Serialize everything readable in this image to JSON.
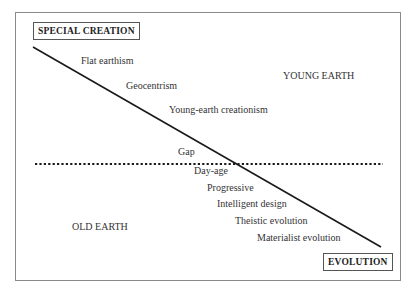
{
  "diagram": {
    "top_left_box": "SPECIAL CREATION",
    "bottom_right_box": "EVOLUTION",
    "region_top_right": "YOUNG EARTH",
    "region_bottom_left": "OLD EARTH",
    "positions": [
      "Flat earthism",
      "Geocentrism",
      "Young-earth creationism",
      "Gap",
      "Day-age",
      "Progressive",
      "Intelligent design",
      "Theistic evolution",
      "Materialist evolution"
    ],
    "colors": {
      "line": "#1a1a1a",
      "frame": "#8a8a8a",
      "text": "#333333"
    }
  }
}
